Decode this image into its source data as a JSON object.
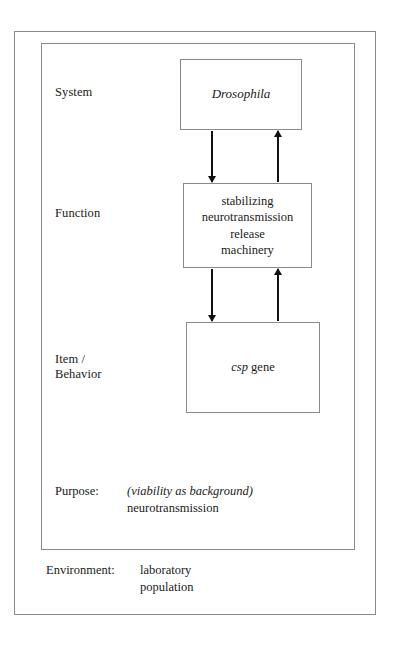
{
  "diagram": {
    "rows": [
      {
        "key": "system",
        "label": "System"
      },
      {
        "key": "function",
        "label": "Function"
      },
      {
        "key": "item",
        "label": "Item /\nBehavior"
      }
    ],
    "boxes": [
      {
        "key": "system",
        "label": "Drosophila",
        "style": "italic"
      },
      {
        "key": "function",
        "label": "stabilizing\nneurotransmission\nrelease\nmachinery",
        "style": "roman"
      },
      {
        "key": "item",
        "label_italic": "csp",
        "label_roman": " gene",
        "label": "csp gene",
        "style": "mixed"
      }
    ],
    "arrows": [
      {
        "key": "system-to-function",
        "direction": "down",
        "from": "system",
        "to": "function"
      },
      {
        "key": "function-to-system",
        "direction": "up",
        "from": "function",
        "to": "system"
      },
      {
        "key": "function-to-item",
        "direction": "down",
        "from": "function",
        "to": "item"
      },
      {
        "key": "item-to-function",
        "direction": "up",
        "from": "item",
        "to": "function"
      }
    ],
    "purpose": {
      "key_label": "Purpose:",
      "value_italic": "(viability as background)",
      "value_roman": "neurotransmission",
      "value": "(viability as background)\nneurotransmission"
    },
    "environment": {
      "key_label": "Environment:",
      "value": "laboratory\npopulation"
    }
  },
  "colors": {
    "background": "#ffffff",
    "frame_stroke": "#8a8a8a",
    "box_stroke": "#8a8a8a",
    "arrow": "#111111",
    "text": "#1a1a1a"
  }
}
